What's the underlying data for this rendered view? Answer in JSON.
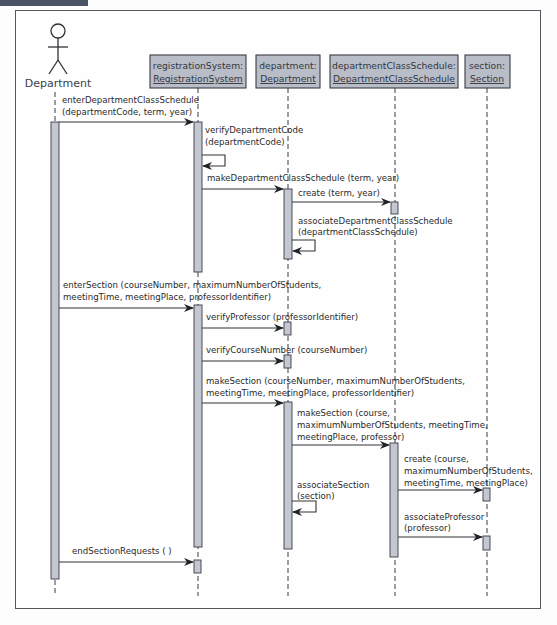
{
  "diagram": {
    "type": "uml-sequence-diagram",
    "actor": {
      "name": "Department"
    },
    "objects": [
      {
        "id": "registrationSystem",
        "line1": "registrationSystem:",
        "line2": "RegistrationSystem"
      },
      {
        "id": "department",
        "line1": "department:",
        "line2": "Department"
      },
      {
        "id": "departmentClassSchedule",
        "line1": "departmentClassSchedule:",
        "line2": "DepartmentClassSchedule"
      },
      {
        "id": "section",
        "line1": "section:",
        "line2": "Section"
      }
    ],
    "messages": [
      {
        "from": "Department",
        "to": "registrationSystem",
        "lines": [
          "enterDepartmentClassSchedule",
          "(departmentCode, term, year)"
        ]
      },
      {
        "from": "registrationSystem",
        "to": "registrationSystem",
        "self": true,
        "lines": [
          "verifyDepartmentCode",
          "(departmentCode)"
        ]
      },
      {
        "from": "registrationSystem",
        "to": "department",
        "lines": [
          "makeDepartmentClassSchedule (term, year)"
        ]
      },
      {
        "from": "department",
        "to": "departmentClassSchedule",
        "lines": [
          "create (term, year)"
        ]
      },
      {
        "from": "department",
        "to": "department",
        "self": true,
        "lines": [
          "associateDepartmentClassSchedule",
          "(departmentClassSchedule)"
        ]
      },
      {
        "from": "Department",
        "to": "registrationSystem",
        "lines": [
          "enterSection (courseNumber, maximumNumberOfStudents,",
          "meetingTime, meetingPlace, professorIdentifier)"
        ]
      },
      {
        "from": "registrationSystem",
        "to": "department",
        "lines": [
          "verifyProfessor (professorIdentifier)"
        ]
      },
      {
        "from": "registrationSystem",
        "to": "department",
        "lines": [
          "verifyCourseNumber (courseNumber)"
        ]
      },
      {
        "from": "registrationSystem",
        "to": "department",
        "lines": [
          "makeSection (courseNumber, maximumNumberOfStudents,",
          "meetingTime, meetingPlace, professorIdentifier)"
        ]
      },
      {
        "from": "department",
        "to": "departmentClassSchedule",
        "lines": [
          "makeSection (course,",
          "maximumNumberOfStudents, meetingTime,",
          "meetingPlace, professor)"
        ]
      },
      {
        "from": "departmentClassSchedule",
        "to": "section",
        "lines": [
          "create (course,",
          "maximumNumberOfStudents,",
          "meetingTime, meetingPlace)"
        ]
      },
      {
        "from": "department",
        "to": "department",
        "self": true,
        "lines": [
          "associateSection",
          "(section)"
        ]
      },
      {
        "from": "departmentClassSchedule",
        "to": "section",
        "lines": [
          "associateProfessor",
          "(professor)"
        ]
      },
      {
        "from": "Department",
        "to": "registrationSystem",
        "lines": [
          "endSectionRequests ( )"
        ]
      }
    ]
  },
  "colors": {
    "frame": "#55585e",
    "object_fill": "#b9bdc8",
    "activation_fill": "#c3c7d2",
    "line": "#2f3238",
    "text": "#2a2a2a"
  }
}
